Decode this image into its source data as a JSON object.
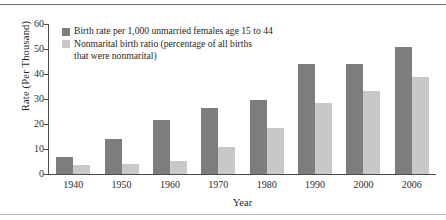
{
  "chart_data": {
    "type": "bar",
    "title": "",
    "xlabel": "Year",
    "ylabel": "Rate (Per Thousand)",
    "ylim": [
      0,
      60
    ],
    "yticks": [
      0,
      10,
      20,
      30,
      40,
      50,
      60
    ],
    "ytick_labels": [
      "0",
      "10",
      "20",
      "30",
      "40",
      "50",
      "60"
    ],
    "grid": false,
    "legend_position": "upper-left-inside",
    "categories": [
      "1940",
      "1950",
      "1960",
      "1970",
      "1980",
      "1990",
      "2000",
      "2006"
    ],
    "series": [
      {
        "name": "Birth rate per 1,000 unmarried females age 15 to 44",
        "color": "#7d7d7d",
        "values": [
          7,
          14,
          21.6,
          26.5,
          29.5,
          44,
          44.2,
          50.8
        ]
      },
      {
        "name": "Nonmarital birth ratio (percentage of all births that were nonmarital)",
        "color": "#c8c8c8",
        "values": [
          3.8,
          4,
          5.3,
          10.8,
          18.4,
          28.3,
          33.2,
          38.8
        ]
      }
    ]
  },
  "legend": {
    "entry_0": "Birth rate per 1,000 unmarried females age 15 to 44",
    "entry_1_line_1": "Nonmarital birth ratio (percentage of all births",
    "entry_1_line_2": "that were nonmarital)"
  },
  "axes": {
    "y_title": "Rate (Per Thousand)",
    "x_title": "Year"
  }
}
